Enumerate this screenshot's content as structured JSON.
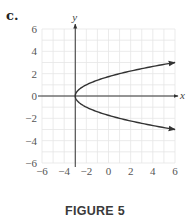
{
  "panel_label": "c.",
  "caption": "FIGURE 5",
  "chart_data": {
    "type": "line",
    "title": "",
    "xlabel": "x",
    "ylabel": "y",
    "xlim": [
      -6,
      6
    ],
    "ylim": [
      -6,
      6
    ],
    "grid": true,
    "grid_step": 1,
    "x_ticks": [
      -6,
      -4,
      -2,
      0,
      2,
      4,
      6
    ],
    "y_ticks": [
      -6,
      -4,
      -2,
      0,
      2,
      4,
      6
    ],
    "x_tick_labels": [
      "−6",
      "−4",
      "−2",
      "0",
      "2",
      "4",
      "6"
    ],
    "y_tick_labels": [
      "−6",
      "−4",
      "−2",
      "0",
      "2",
      "4",
      "6"
    ],
    "vertical_axis_at_x": -3,
    "horizontal_axis_at_y": 0,
    "equation": "x = y^2 - 3",
    "series": [
      {
        "name": "upper-branch",
        "x": [
          -3,
          -2.75,
          -2,
          -1,
          0,
          1,
          2,
          3,
          4,
          5,
          6
        ],
        "y": [
          0,
          0.5,
          1,
          1.414,
          1.732,
          2,
          2.236,
          2.449,
          2.646,
          2.828,
          3
        ],
        "arrow_end": true
      },
      {
        "name": "lower-branch",
        "x": [
          -3,
          -2.75,
          -2,
          -1,
          0,
          1,
          2,
          3,
          4,
          5,
          6
        ],
        "y": [
          0,
          -0.5,
          -1,
          -1.414,
          -1.732,
          -2,
          -2.236,
          -2.449,
          -2.646,
          -2.828,
          -3
        ],
        "arrow_end": true
      }
    ]
  }
}
